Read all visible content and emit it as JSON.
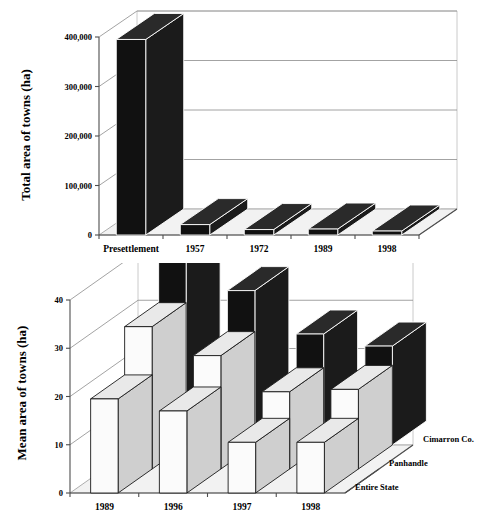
{
  "figure": {
    "background_color": "#ffffff",
    "panels": [
      "top",
      "bottom"
    ]
  },
  "chart_data": [
    {
      "id": "total-area-chart",
      "type": "bar",
      "title": "",
      "xlabel": "",
      "ylabel": "Total area of towns  (ha)",
      "categories": [
        "Presettlement",
        "1957",
        "1972",
        "1989",
        "1998"
      ],
      "values": [
        395000,
        21000,
        11000,
        12000,
        8000
      ],
      "tick_labels": [
        "0",
        "100,000",
        "200,000",
        "300,000",
        "400,000"
      ],
      "tick_values": [
        0,
        100000,
        200000,
        300000,
        400000
      ],
      "ylim": [
        0,
        400000
      ],
      "grid": true,
      "legend": "none",
      "three_d": true,
      "series": [
        {
          "name": "Total area",
          "color": "#111111",
          "values": [
            395000,
            21000,
            11000,
            12000,
            8000
          ]
        }
      ]
    },
    {
      "id": "mean-area-chart",
      "type": "bar",
      "title": "",
      "xlabel": "",
      "ylabel": "Mean area of towns (ha)",
      "categories": [
        "1989",
        "1996",
        "1997",
        "1998"
      ],
      "tick_labels": [
        "0",
        "10",
        "20",
        "30",
        "40"
      ],
      "tick_values": [
        0,
        10,
        20,
        30,
        40
      ],
      "ylim": [
        0,
        40
      ],
      "grid": true,
      "legend_position": "right-depth-axis",
      "three_d": true,
      "series": [
        {
          "name": "Entire State",
          "color": "#fbfbfb",
          "values": [
            19.5,
            17.0,
            10.5,
            10.5
          ]
        },
        {
          "name": "Panhandle",
          "color": "#e9e9e9",
          "values": [
            29.5,
            23.5,
            16.0,
            16.5
          ]
        },
        {
          "name": "Cimarron Co.",
          "color": "#111111",
          "values": [
            44.5,
            32.0,
            23.0,
            20.5
          ]
        }
      ]
    }
  ]
}
